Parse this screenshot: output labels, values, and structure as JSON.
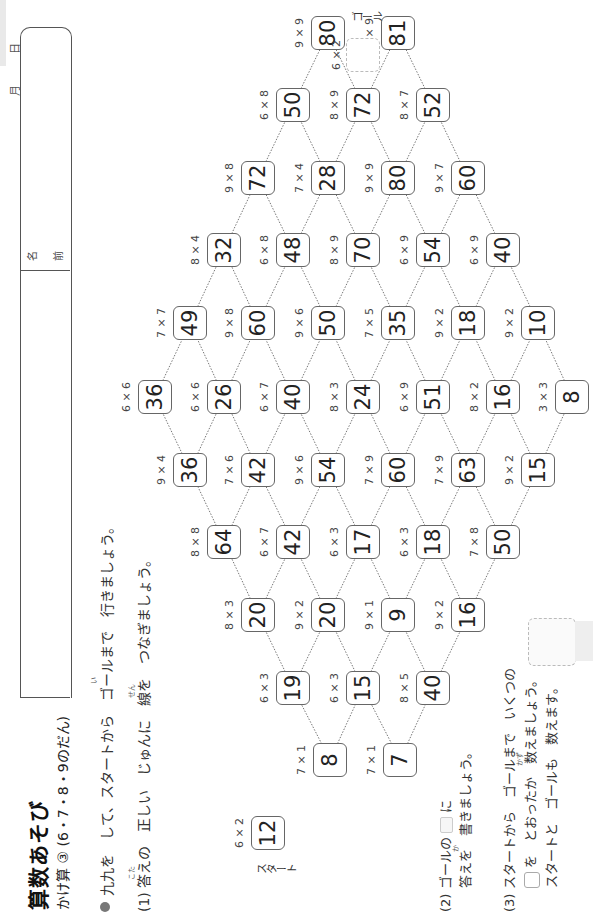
{
  "header": {
    "date_month": "月",
    "date_day": "日",
    "name_label_1": "名",
    "name_label_2": "前"
  },
  "title": {
    "main": "算数あそび",
    "sub": "かけ算 ③ (6・7・8・9のだん)"
  },
  "instructions": {
    "intro": "九九を　して、スタートから　ゴールまで　行きましょう。",
    "intro_ruby": "い",
    "q1": "(1)  答えの　正しい　じゅんに　線を　つなぎましょう。",
    "q1_ruby_1": "こた",
    "q1_ruby_2": "せん",
    "q2_line1_a": "(2)  ゴールの",
    "q2_line1_b": "に",
    "q2_line2": "答えを　書きましょう。",
    "q2_ruby": "か",
    "q3_line1": "(3)  スタートから　ゴールまで　いくつの",
    "q3_line2_b": "を　とおったか　数えましょう。",
    "q3_ruby": "かず",
    "q3_line3": "スタートと　ゴールも　数えます。"
  },
  "maze": {
    "start_label": "スタート",
    "goal_label": "ゴール",
    "goal_expr": "6 × 2",
    "cells": [
      {
        "value": "12",
        "expr": "6 × 2",
        "x": 83,
        "y": 268
      },
      {
        "value": "8",
        "expr": "7 × 1",
        "x": 156,
        "y": 330
      },
      {
        "value": "7",
        "expr": "7 × 1",
        "x": 156,
        "y": 400
      },
      {
        "value": "19",
        "expr": "6 × 3",
        "x": 228,
        "y": 293
      },
      {
        "value": "15",
        "expr": "6 × 3",
        "x": 228,
        "y": 363
      },
      {
        "value": "40",
        "expr": "8 × 5",
        "x": 228,
        "y": 433
      },
      {
        "value": "20",
        "expr": "8 × 3",
        "x": 301,
        "y": 258
      },
      {
        "value": "20",
        "expr": "9 × 2",
        "x": 301,
        "y": 328
      },
      {
        "value": "9",
        "expr": "9 × 1",
        "x": 301,
        "y": 398
      },
      {
        "value": "16",
        "expr": "9 × 2",
        "x": 301,
        "y": 468
      },
      {
        "value": "64",
        "expr": "8 × 8",
        "x": 374,
        "y": 224
      },
      {
        "value": "42",
        "expr": "6 × 7",
        "x": 374,
        "y": 293
      },
      {
        "value": "17",
        "expr": "6 × 3",
        "x": 374,
        "y": 363
      },
      {
        "value": "18",
        "expr": "6 × 3",
        "x": 374,
        "y": 433
      },
      {
        "value": "50",
        "expr": "7 × 8",
        "x": 374,
        "y": 503
      },
      {
        "value": "36",
        "expr": "9 × 4",
        "x": 446,
        "y": 190
      },
      {
        "value": "42",
        "expr": "7 × 6",
        "x": 446,
        "y": 258
      },
      {
        "value": "54",
        "expr": "9 × 6",
        "x": 446,
        "y": 328
      },
      {
        "value": "60",
        "expr": "7 × 9",
        "x": 446,
        "y": 398
      },
      {
        "value": "63",
        "expr": "7 × 9",
        "x": 446,
        "y": 468
      },
      {
        "value": "15",
        "expr": "9 × 2",
        "x": 446,
        "y": 538
      },
      {
        "value": "36",
        "expr": "6 × 6",
        "x": 519,
        "y": 155
      },
      {
        "value": "26",
        "expr": "6 × 6",
        "x": 519,
        "y": 224
      },
      {
        "value": "40",
        "expr": "6 × 7",
        "x": 519,
        "y": 293
      },
      {
        "value": "24",
        "expr": "8 × 3",
        "x": 519,
        "y": 363
      },
      {
        "value": "51",
        "expr": "6 × 9",
        "x": 519,
        "y": 433
      },
      {
        "value": "16",
        "expr": "8 × 2",
        "x": 519,
        "y": 503
      },
      {
        "value": "8",
        "expr": "3 × 3",
        "x": 519,
        "y": 572
      },
      {
        "value": "49",
        "expr": "7 × 7",
        "x": 593,
        "y": 190
      },
      {
        "value": "60",
        "expr": "9 × 8",
        "x": 593,
        "y": 258
      },
      {
        "value": "50",
        "expr": "9 × 6",
        "x": 593,
        "y": 328
      },
      {
        "value": "35",
        "expr": "7 × 5",
        "x": 593,
        "y": 398
      },
      {
        "value": "18",
        "expr": "9 × 2",
        "x": 593,
        "y": 468
      },
      {
        "value": "10",
        "expr": "9 × 2",
        "x": 593,
        "y": 538
      },
      {
        "value": "32",
        "expr": "8 × 4",
        "x": 666,
        "y": 224
      },
      {
        "value": "48",
        "expr": "6 × 8",
        "x": 666,
        "y": 293
      },
      {
        "value": "70",
        "expr": "8 × 9",
        "x": 666,
        "y": 363
      },
      {
        "value": "54",
        "expr": "6 × 9",
        "x": 666,
        "y": 433
      },
      {
        "value": "40",
        "expr": "6 × 9",
        "x": 666,
        "y": 503
      },
      {
        "value": "72",
        "expr": "9 × 8",
        "x": 738,
        "y": 258
      },
      {
        "value": "28",
        "expr": "7 × 4",
        "x": 738,
        "y": 328
      },
      {
        "value": "80",
        "expr": "9 × 9",
        "x": 738,
        "y": 398
      },
      {
        "value": "60",
        "expr": "9 × 7",
        "x": 738,
        "y": 468
      },
      {
        "value": "50",
        "expr": "6 × 8",
        "x": 811,
        "y": 293
      },
      {
        "value": "72",
        "expr": "8 × 9",
        "x": 811,
        "y": 363
      },
      {
        "value": "52",
        "expr": "8 × 7",
        "x": 811,
        "y": 433
      },
      {
        "value": "80",
        "expr": "9 × 9",
        "x": 883,
        "y": 328
      },
      {
        "value": "81",
        "expr": "9 × 9",
        "x": 883,
        "y": 398
      }
    ],
    "goal": {
      "x": 956,
      "y": 363
    }
  }
}
